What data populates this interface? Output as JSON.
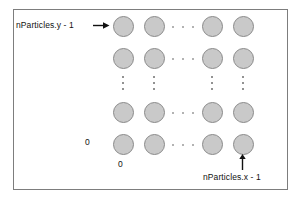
{
  "figure": {
    "frame": {
      "border_color": "#7d7d7d",
      "background": "#ffffff"
    },
    "particle_style": {
      "fill": "#c9c9c9",
      "stroke": "#8a8a8a",
      "diameter_px": 21
    },
    "grid": {
      "rows": 4,
      "columns": 4,
      "column_centers_px": [
        122,
        153,
        211,
        242
      ],
      "row_centers_px": [
        25,
        57,
        111,
        143
      ],
      "horizontal_ellipsis_x_px": 182,
      "vertical_ellipsis_y_px": 84
    },
    "labels": {
      "y_max": "nParticles.y - 1",
      "x_max": "nParticles.x - 1",
      "y_zero": "0",
      "x_zero": "0"
    },
    "icons": {
      "y_max_arrow": "arrow-right-icon",
      "x_max_arrow": "arrow-up-icon",
      "row_gap": "horizontal-ellipsis-icon",
      "column_gap": "vertical-ellipsis-icon"
    }
  }
}
